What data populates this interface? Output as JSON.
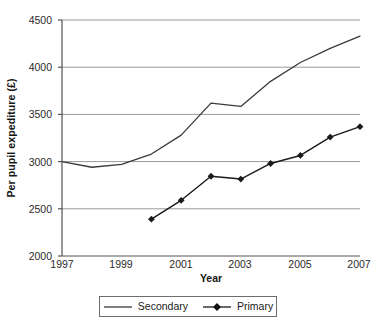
{
  "chart_data": {
    "type": "line",
    "title": "",
    "xlabel": "Year",
    "ylabel": "Per pupil expediture (£)",
    "x": [
      1997,
      1998,
      1999,
      2000,
      2001,
      2002,
      2003,
      2004,
      2005,
      2006,
      2007
    ],
    "xlim": [
      1997,
      2007
    ],
    "ylim": [
      2000,
      4500
    ],
    "xticks": [
      "1997",
      "1999",
      "2001",
      "2003",
      "2005",
      "2007"
    ],
    "xtick_values": [
      1997,
      1999,
      2001,
      2003,
      2005,
      2007
    ],
    "yticks": [
      "2000",
      "2500",
      "3000",
      "3500",
      "4000",
      "4500"
    ],
    "ytick_values": [
      2000,
      2500,
      3000,
      3500,
      4000,
      4500
    ],
    "grid": "horizontal",
    "legend_position": "bottom",
    "series": [
      {
        "name": "Secondary",
        "marker": "none",
        "color": "#3a3a3a",
        "x": [
          1997,
          1998,
          1999,
          2000,
          2001,
          2002,
          2003,
          2004,
          2005,
          2006,
          2007
        ],
        "values": [
          3000,
          2940,
          2970,
          3080,
          3280,
          3620,
          3585,
          3850,
          4050,
          4200,
          4330
        ]
      },
      {
        "name": "Primary",
        "marker": "diamond",
        "color": "#1a1a1a",
        "x": [
          2000,
          2001,
          2002,
          2003,
          2004,
          2005,
          2006,
          2007
        ],
        "values": [
          2390,
          2590,
          2845,
          2815,
          2980,
          3065,
          3260,
          3370
        ]
      }
    ]
  },
  "legend": {
    "entries": [
      {
        "label": "Secondary"
      },
      {
        "label": "Primary"
      }
    ]
  },
  "axis": {
    "y_title": "Per pupil expediture (£)",
    "x_title": "Year",
    "y_tick_labels": [
      "4500",
      "4000",
      "3500",
      "3000",
      "2500",
      "2000"
    ],
    "x_tick_labels": [
      "1997",
      "1999",
      "2001",
      "2003",
      "2005",
      "2007"
    ]
  }
}
